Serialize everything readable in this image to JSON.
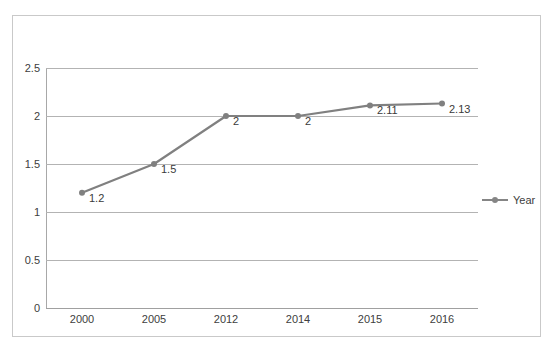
{
  "chart_data": {
    "type": "line",
    "title": "",
    "subtitle": "",
    "xlabel": "",
    "ylabel": "",
    "categories": [
      "2000",
      "2005",
      "2012",
      "2014",
      "2015",
      "2016"
    ],
    "series": [
      {
        "name": "Year",
        "values": [
          1.2,
          1.5,
          2,
          2,
          2.11,
          2.13
        ],
        "labels": [
          "1.2",
          "1.5",
          "2",
          "2",
          "2.11",
          "2.13"
        ],
        "color": "#808080",
        "marker": "circle"
      }
    ],
    "ylim": [
      0,
      2.5
    ],
    "y_ticks": [
      "0",
      "0.5",
      "1",
      "1.5",
      "2",
      "2.5"
    ],
    "y_tick_values": [
      0,
      0.5,
      1,
      1.5,
      2,
      2.5
    ],
    "grid": "horizontal",
    "legend": {
      "position": "right",
      "entries": [
        {
          "label": "Year",
          "color": "#858585",
          "marker": "circle"
        }
      ]
    },
    "colors": {
      "series": "#808080",
      "gridline": "#b3b3b3",
      "axis": "#a8a8a8",
      "frame": "#c9c9c9",
      "text": "#404040",
      "background": "#ffffff"
    }
  }
}
